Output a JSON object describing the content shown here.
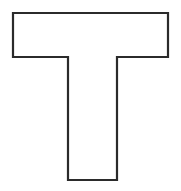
{
  "image": {
    "title": "Letter T outline",
    "width": 181,
    "height": 191,
    "background_color": "#ffffff",
    "description": "Black outline drawing of a capital letter T on a plain white background"
  },
  "shape": {
    "name": "letter-t-outline",
    "glyph": "T",
    "stroke_color": "#2b2b2b",
    "fill_color": "#ffffff",
    "stroke_width": 2.2,
    "points": [
      [
        13,
        13
      ],
      [
        168,
        13
      ],
      [
        168,
        57
      ],
      [
        117,
        57
      ],
      [
        117,
        180
      ],
      [
        68,
        180
      ],
      [
        68,
        57
      ],
      [
        13,
        57
      ]
    ],
    "geometry": {
      "bar_left": 13,
      "bar_right": 168,
      "bar_top": 13,
      "bar_bottom": 57,
      "stem_left": 68,
      "stem_right": 117,
      "stem_bottom": 180,
      "bar_width": 155,
      "bar_height": 44,
      "stem_width": 49,
      "stem_height": 123
    }
  }
}
